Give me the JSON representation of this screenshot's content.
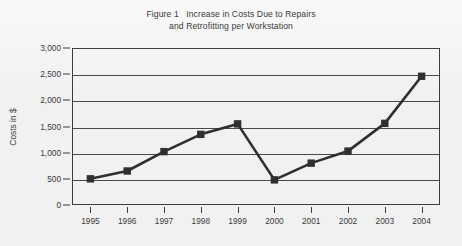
{
  "figure": {
    "title_line1": "Figure 1   Increase in Costs Due to Repairs",
    "title_line2": "and Retrofitting per Workstation"
  },
  "chart_data": {
    "type": "line",
    "title": "Figure 1   Increase in Costs Due to Repairs and Retrofitting per Workstation",
    "xlabel": "",
    "ylabel": "Costs in $",
    "categories": [
      "1995",
      "1996",
      "1997",
      "1998",
      "1999",
      "2000",
      "2001",
      "2002",
      "2003",
      "2004"
    ],
    "values": [
      500,
      650,
      1020,
      1350,
      1550,
      480,
      800,
      1030,
      1560,
      2460
    ],
    "ylim": [
      0,
      3000
    ],
    "ytick_labels": [
      "0",
      "500",
      "1,000",
      "1,500",
      "2,000",
      "2,500",
      "3,000"
    ],
    "ytick_values": [
      0,
      500,
      1000,
      1500,
      2000,
      2500,
      3000
    ],
    "grid": "horizontal",
    "legend": "none",
    "marker": "square",
    "series_color": "#2f2f2f",
    "axis_color": "#3d3d3d",
    "background_color": "#f1f1f1"
  }
}
